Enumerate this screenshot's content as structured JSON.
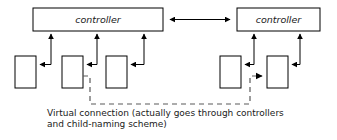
{
  "diagram": {
    "title_label": "",
    "colors": {
      "stroke": "#000000",
      "box_fill": "#ffffff",
      "text": "#1a1a1a",
      "dashed_stroke": "#5a5a5a",
      "background": "#ffffff"
    },
    "controllers": [
      {
        "id": "controller-left",
        "label": "controller"
      },
      {
        "id": "controller-right",
        "label": "controller"
      }
    ],
    "child_nodes": [
      {
        "id": "node-left-1",
        "label": ""
      },
      {
        "id": "node-left-2",
        "label": ""
      },
      {
        "id": "node-left-3",
        "label": ""
      },
      {
        "id": "node-right-1",
        "label": ""
      },
      {
        "id": "node-right-2",
        "label": ""
      }
    ],
    "connections": {
      "controller_link": {
        "style": "solid",
        "arrowheads": "both"
      },
      "child_links": {
        "style": "solid",
        "arrowheads": "single"
      },
      "virtual_link": {
        "style": "dashed",
        "arrowheads": "single",
        "from": "node-left-2",
        "to": "node-right-2"
      }
    },
    "caption": {
      "line1": "Virtual connection (actually goes through controllers",
      "line2": "and child-naming scheme)"
    }
  }
}
